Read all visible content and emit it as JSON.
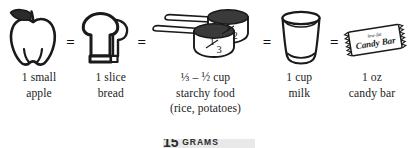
{
  "figure": {
    "name": "carbohydrate-serving-equivalents",
    "operator": "=",
    "items": [
      {
        "icon": "apple-icon",
        "icon_label": "small apple outline drawing",
        "caption_lines": [
          "1 small",
          "apple"
        ]
      },
      {
        "icon": "bread-slice-icon",
        "icon_label": "slice of bread outline drawing",
        "caption_lines": [
          "1 slice",
          "bread"
        ]
      },
      {
        "icon": "measuring-cups-icon",
        "icon_label": "two stacked measuring cups",
        "cup_labels": [
          "1/2",
          "1/3"
        ],
        "caption_lines": [
          "⅓ – ½ cup",
          "starchy food",
          "(rice, potatoes)"
        ]
      },
      {
        "icon": "milk-glass-icon",
        "icon_label": "glass of milk outline drawing",
        "caption_lines": [
          "1 cup",
          "milk"
        ]
      },
      {
        "icon": "candy-bar-icon",
        "icon_label": "wrapped candy bar",
        "wrapper_top_text": "low-fat",
        "wrapper_text": "Candy Bar",
        "caption_lines": [
          "1 oz",
          "candy bar"
        ]
      }
    ],
    "footer_banner": {
      "number": "15",
      "unit": "grams"
    }
  },
  "colors": {
    "ink": "#1a1a1a",
    "fill_dark": "#3a3a3a",
    "banner_background": "#e9e9e9",
    "page_background": "#ffffff"
  }
}
